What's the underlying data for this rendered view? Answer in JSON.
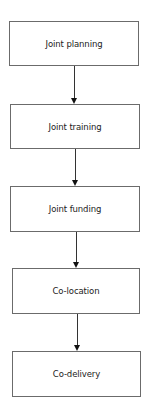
{
  "diagram": {
    "type": "vertical-flowchart",
    "nodes": [
      {
        "id": "n1",
        "label": "Joint planning"
      },
      {
        "id": "n2",
        "label": "Joint training"
      },
      {
        "id": "n3",
        "label": "Joint funding"
      },
      {
        "id": "n4",
        "label": "Co-location"
      },
      {
        "id": "n5",
        "label": "Co-delivery"
      }
    ],
    "edges": [
      {
        "from": "n1",
        "to": "n2"
      },
      {
        "from": "n2",
        "to": "n3"
      },
      {
        "from": "n3",
        "to": "n4"
      },
      {
        "from": "n4",
        "to": "n5"
      }
    ],
    "colors": {
      "border": "#6b6b6b",
      "arrow": "#111111",
      "text": "#222222"
    }
  }
}
